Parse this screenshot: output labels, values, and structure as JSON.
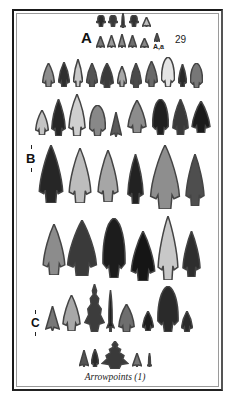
{
  "page": {
    "plate_number": "29",
    "caption": "Arrowpoints (1)",
    "labels": {
      "a": "A",
      "a_sub": "A,a",
      "b": "B",
      "c": "C"
    }
  },
  "rows": [
    {
      "name": "row-a-top",
      "points": [
        {
          "x": 96,
          "y": 15,
          "w": 10,
          "h": 12,
          "shape": "round-barb",
          "color": "#2b2b2b"
        },
        {
          "x": 108,
          "y": 15,
          "w": 10,
          "h": 12,
          "shape": "round-barb",
          "color": "#3a3a3a"
        },
        {
          "x": 120,
          "y": 13,
          "w": 6,
          "h": 15,
          "shape": "stem",
          "color": "#1f1f1f"
        },
        {
          "x": 129,
          "y": 15,
          "w": 10,
          "h": 12,
          "shape": "round-barb",
          "color": "#333"
        },
        {
          "x": 142,
          "y": 17,
          "w": 9,
          "h": 10,
          "shape": "tri",
          "color": "#bdbdbd"
        }
      ]
    },
    {
      "name": "row-a-bottom",
      "points": [
        {
          "x": 96,
          "y": 36,
          "w": 9,
          "h": 12,
          "shape": "tri",
          "color": "#7a7a7a"
        },
        {
          "x": 107,
          "y": 35,
          "w": 9,
          "h": 13,
          "shape": "tri",
          "color": "#9a9a9a"
        },
        {
          "x": 118,
          "y": 34,
          "w": 8,
          "h": 14,
          "shape": "tri",
          "color": "#8a8a8a"
        },
        {
          "x": 128,
          "y": 35,
          "w": 9,
          "h": 13,
          "shape": "tri",
          "color": "#6e6e6e"
        },
        {
          "x": 140,
          "y": 38,
          "w": 9,
          "h": 10,
          "shape": "tri",
          "color": "#888"
        },
        {
          "x": 154,
          "y": 33,
          "w": 6,
          "h": 9,
          "shape": "tri",
          "color": "#555"
        }
      ]
    },
    {
      "name": "row-2",
      "points": [
        {
          "x": 42,
          "y": 63,
          "w": 13,
          "h": 24,
          "shape": "notched",
          "color": "#8d8d8d"
        },
        {
          "x": 58,
          "y": 62,
          "w": 12,
          "h": 25,
          "shape": "notched",
          "color": "#2e2e2e"
        },
        {
          "x": 73,
          "y": 59,
          "w": 10,
          "h": 28,
          "shape": "notched",
          "color": "#c8c8c8"
        },
        {
          "x": 86,
          "y": 63,
          "w": 12,
          "h": 24,
          "shape": "notched",
          "color": "#555"
        },
        {
          "x": 100,
          "y": 63,
          "w": 14,
          "h": 25,
          "shape": "notched",
          "color": "#3a3a3a"
        },
        {
          "x": 117,
          "y": 66,
          "w": 10,
          "h": 21,
          "shape": "notched",
          "color": "#a8a8a8"
        },
        {
          "x": 130,
          "y": 63,
          "w": 12,
          "h": 25,
          "shape": "notched",
          "color": "#4a4a4a"
        },
        {
          "x": 145,
          "y": 61,
          "w": 13,
          "h": 26,
          "shape": "notched",
          "color": "#6a6a6a"
        },
        {
          "x": 161,
          "y": 57,
          "w": 14,
          "h": 30,
          "shape": "round",
          "color": "#e4e4e4"
        },
        {
          "x": 178,
          "y": 64,
          "w": 9,
          "h": 23,
          "shape": "notched",
          "color": "#2a2a2a"
        },
        {
          "x": 190,
          "y": 63,
          "w": 13,
          "h": 25,
          "shape": "round",
          "color": "#777"
        }
      ]
    },
    {
      "name": "row-3",
      "points": [
        {
          "x": 35,
          "y": 110,
          "w": 14,
          "h": 25,
          "shape": "notched",
          "color": "#c4c4c4"
        },
        {
          "x": 51,
          "y": 99,
          "w": 15,
          "h": 37,
          "shape": "notched",
          "color": "#262626"
        },
        {
          "x": 68,
          "y": 94,
          "w": 18,
          "h": 42,
          "shape": "notched",
          "color": "#cfcfcf"
        },
        {
          "x": 89,
          "y": 105,
          "w": 17,
          "h": 31,
          "shape": "round",
          "color": "#888"
        },
        {
          "x": 110,
          "y": 112,
          "w": 12,
          "h": 25,
          "shape": "tri",
          "color": "#5a5a5a"
        },
        {
          "x": 127,
          "y": 100,
          "w": 20,
          "h": 33,
          "shape": "notched",
          "color": "#8c8c8c"
        },
        {
          "x": 152,
          "y": 99,
          "w": 17,
          "h": 36,
          "shape": "round",
          "color": "#202020"
        },
        {
          "x": 172,
          "y": 99,
          "w": 17,
          "h": 36,
          "shape": "notched",
          "color": "#3a3a3a"
        },
        {
          "x": 191,
          "y": 101,
          "w": 20,
          "h": 32,
          "shape": "notched",
          "color": "#1b1b1b"
        }
      ]
    },
    {
      "name": "row-b",
      "points": [
        {
          "x": 38,
          "y": 145,
          "w": 26,
          "h": 58,
          "shape": "notched",
          "color": "#262626"
        },
        {
          "x": 68,
          "y": 148,
          "w": 24,
          "h": 55,
          "shape": "notched",
          "color": "#bdbdbd"
        },
        {
          "x": 97,
          "y": 150,
          "w": 22,
          "h": 52,
          "shape": "notched",
          "color": "#a6a6a6"
        },
        {
          "x": 127,
          "y": 154,
          "w": 17,
          "h": 50,
          "shape": "notched",
          "color": "#222"
        },
        {
          "x": 149,
          "y": 145,
          "w": 32,
          "h": 64,
          "shape": "notched",
          "color": "#8e8e8e"
        },
        {
          "x": 185,
          "y": 154,
          "w": 20,
          "h": 52,
          "shape": "notched",
          "color": "#4e4e4e"
        }
      ]
    },
    {
      "name": "row-4",
      "points": [
        {
          "x": 42,
          "y": 224,
          "w": 24,
          "h": 51,
          "shape": "notched",
          "color": "#8c8c8c"
        },
        {
          "x": 66,
          "y": 220,
          "w": 32,
          "h": 56,
          "shape": "notched",
          "color": "#3a3a3a"
        },
        {
          "x": 102,
          "y": 218,
          "w": 24,
          "h": 60,
          "shape": "round",
          "color": "#1c1c1c"
        },
        {
          "x": 130,
          "y": 231,
          "w": 26,
          "h": 50,
          "shape": "notched",
          "color": "#151515"
        },
        {
          "x": 157,
          "y": 216,
          "w": 22,
          "h": 64,
          "shape": "notched",
          "color": "#c8c8c8"
        },
        {
          "x": 182,
          "y": 231,
          "w": 19,
          "h": 46,
          "shape": "notched",
          "color": "#2e2e2e"
        }
      ]
    },
    {
      "name": "row-c",
      "points": [
        {
          "x": 45,
          "y": 306,
          "w": 15,
          "h": 25,
          "shape": "tri",
          "color": "#777"
        },
        {
          "x": 62,
          "y": 295,
          "w": 19,
          "h": 36,
          "shape": "notched",
          "color": "#a8a8a8"
        },
        {
          "x": 84,
          "y": 284,
          "w": 21,
          "h": 48,
          "shape": "jagged",
          "color": "#3c3c3c"
        },
        {
          "x": 106,
          "y": 290,
          "w": 9,
          "h": 42,
          "shape": "stem",
          "color": "#1f1f1f"
        },
        {
          "x": 118,
          "y": 304,
          "w": 17,
          "h": 28,
          "shape": "notched",
          "color": "#6e6e6e"
        },
        {
          "x": 142,
          "y": 311,
          "w": 12,
          "h": 20,
          "shape": "notched",
          "color": "#1e1e1e"
        },
        {
          "x": 157,
          "y": 286,
          "w": 22,
          "h": 46,
          "shape": "round",
          "color": "#2a2a2a"
        },
        {
          "x": 181,
          "y": 311,
          "w": 12,
          "h": 21,
          "shape": "notched",
          "color": "#2a2a2a"
        }
      ]
    },
    {
      "name": "row-bottom",
      "points": [
        {
          "x": 79,
          "y": 350,
          "w": 10,
          "h": 17,
          "shape": "tri",
          "color": "#555"
        },
        {
          "x": 91,
          "y": 349,
          "w": 8,
          "h": 18,
          "shape": "notched",
          "color": "#2a2a2a"
        },
        {
          "x": 101,
          "y": 341,
          "w": 28,
          "h": 28,
          "shape": "jagged",
          "color": "#3a3a3a"
        },
        {
          "x": 132,
          "y": 353,
          "w": 10,
          "h": 14,
          "shape": "tri",
          "color": "#777"
        },
        {
          "x": 147,
          "y": 353,
          "w": 5,
          "h": 14,
          "shape": "stem",
          "color": "#444"
        }
      ]
    }
  ]
}
